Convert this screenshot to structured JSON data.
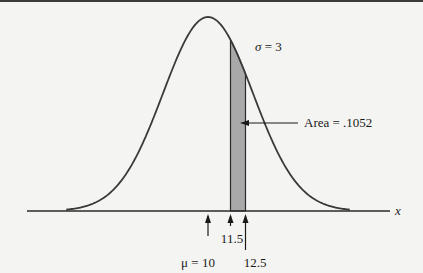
{
  "chart_data": {
    "type": "area",
    "title": "",
    "distribution": "normal",
    "mean": 10,
    "sd": 3,
    "shaded_interval": [
      11.5,
      12.5
    ],
    "shaded_area": 0.1052,
    "xlabel": "x",
    "markers": [
      {
        "value": 10,
        "label": "μ = 10"
      },
      {
        "value": 11.5,
        "label": "11.5"
      },
      {
        "value": 12.5,
        "label": "12.5"
      }
    ],
    "annotations": {
      "sigma": "σ = 3",
      "area": "Area = .1052"
    },
    "colors": {
      "curve": "#3a3a3a",
      "shade": "#a9a9a9",
      "axis": "#2a2a2a"
    }
  }
}
